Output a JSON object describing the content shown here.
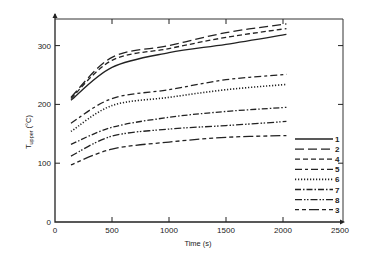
{
  "chart_data": {
    "type": "line",
    "title": "",
    "xlabel": "Time (s)",
    "ylabel": "T_upper (°C)",
    "ylabel_main": "T",
    "ylabel_sub": "upper",
    "ylabel_unit": "(°C)",
    "xlim": [
      0,
      2500
    ],
    "ylim": [
      0,
      350
    ],
    "xticks": [
      0,
      500,
      1000,
      1500,
      2000,
      2500
    ],
    "yticks": [
      0,
      100,
      200,
      300
    ],
    "grid": false,
    "legend_position": "inside right, lower",
    "x": [
      140,
      500,
      1000,
      1500,
      2030
    ],
    "series": [
      {
        "name": "1",
        "style": "solid",
        "values": [
          207,
          263,
          288,
          302,
          319
        ]
      },
      {
        "name": "2",
        "style": "long-dash",
        "values": [
          212,
          280,
          300,
          322,
          337
        ]
      },
      {
        "name": "4",
        "style": "short-dash",
        "values": [
          210,
          275,
          295,
          314,
          329
        ]
      },
      {
        "name": "5",
        "style": "dash-short-dash",
        "values": [
          168,
          210,
          225,
          242,
          251
        ]
      },
      {
        "name": "6",
        "style": "dotted",
        "values": [
          154,
          198,
          212,
          225,
          234
        ]
      },
      {
        "name": "7",
        "style": "dash-dot",
        "values": [
          132,
          161,
          178,
          188,
          195
        ]
      },
      {
        "name": "8",
        "style": "dash-dot-dot",
        "values": [
          112,
          146,
          158,
          164,
          171
        ]
      },
      {
        "name": "3",
        "style": "dash-dash-long",
        "values": [
          97,
          124,
          136,
          144,
          147
        ]
      }
    ]
  },
  "axes": {
    "x_tick_labels": [
      "0",
      "500",
      "1000",
      "1500",
      "2000",
      "2500"
    ],
    "y_tick_labels": [
      "0",
      "100",
      "200",
      "300"
    ],
    "x_title": "Time (s)"
  },
  "legend": {
    "items": [
      {
        "label": "1",
        "style": "solid"
      },
      {
        "label": "2",
        "style": "long-dash"
      },
      {
        "label": "4",
        "style": "short-dash"
      },
      {
        "label": "5",
        "style": "dash-short-dash"
      },
      {
        "label": "6",
        "style": "dotted"
      },
      {
        "label": "7",
        "style": "dash-dot"
      },
      {
        "label": "8",
        "style": "dash-dot-dot"
      },
      {
        "label": "3",
        "style": "dash-dash-long"
      }
    ]
  }
}
